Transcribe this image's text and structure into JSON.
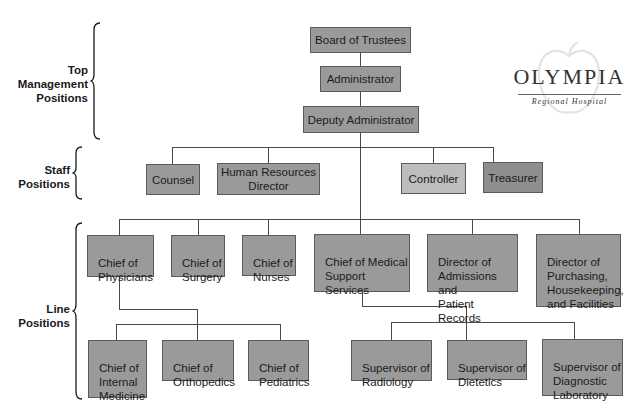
{
  "logo": {
    "title": "OLYMPIA",
    "subtitle": "Regional Hospital"
  },
  "groups": {
    "top": "Top\nManagement\nPositions",
    "staff": "Staff\nPositions",
    "line": "Line\nPositions"
  },
  "top_management": {
    "board": "Board of Trustees",
    "administrator": "Administrator",
    "deputy": "Deputy Administrator"
  },
  "staff": {
    "counsel": "Counsel",
    "hr": "Human Resources\nDirector",
    "controller": "Controller",
    "treasurer": "Treasurer"
  },
  "line": {
    "physicians": "Chief of\nPhysicians",
    "surgery": "Chief of\nSurgery",
    "nurses": "Chief of\nNurses",
    "medical_support": "Chief of Medical\nSupport\nServices",
    "admissions": "Director of\nAdmissions and\nPatient Records",
    "purchasing": "Director of\nPurchasing,\nHousekeeping,\nand Facilities"
  },
  "sub_physicians": {
    "internal": "Chief of\nInternal\nMedicine",
    "orthopedics": "Chief of\nOrthopedics",
    "pediatrics": "Chief of\nPediatrics"
  },
  "sub_medical": {
    "radiology": "Supervisor of\nRadiology",
    "dietetics": "Supervisor of\nDietetics",
    "lab": "Supervisor of\nDiagnostic\nLaboratory"
  },
  "colors": {
    "box": "#9a9a9a",
    "box_light": "#bdbdbd",
    "box_dark": "#8e8e8e",
    "line": "#4a4a4a"
  }
}
